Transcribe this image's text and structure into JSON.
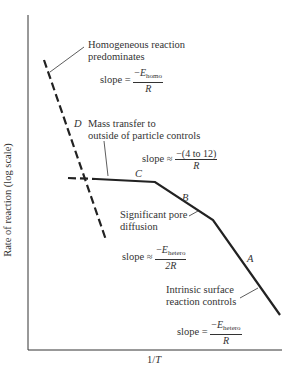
{
  "figure": {
    "ylabel": "Rate of reaction (log scale)",
    "xlabel_prefix": "1/",
    "xlabel_var": "T",
    "regions": [
      {
        "letter": "D",
        "line_style": "dashed",
        "description_line1": "Homogeneous reaction",
        "description_line2": "predominates",
        "slope_prefix": "slope =",
        "slope_num_sign": "−",
        "slope_num_var": "E",
        "slope_num_sub": "homo",
        "slope_den": "R"
      },
      {
        "letter": "C",
        "line_style": "solid",
        "description_line1": "Mass transfer to",
        "description_line2": "outside of particle controls",
        "slope_prefix": "slope ≈",
        "slope_num": "−(4 to 12)",
        "slope_den": "R"
      },
      {
        "letter": "B",
        "line_style": "solid",
        "description_line1": "Significant pore",
        "description_line2": "diffusion",
        "slope_prefix": "slope ≈",
        "slope_num_sign": "−",
        "slope_num_var": "E",
        "slope_num_sub": "hetero",
        "slope_den": "2R"
      },
      {
        "letter": "A",
        "line_style": "solid",
        "description_line1": "Intrinsic surface",
        "description_line2": "reaction controls",
        "slope_prefix": "slope =",
        "slope_num_sign": "−",
        "slope_num_var": "E",
        "slope_num_sub": "hetero",
        "slope_den": "R"
      }
    ]
  }
}
